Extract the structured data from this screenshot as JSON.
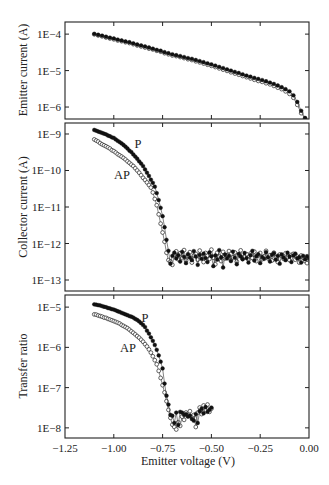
{
  "figure": {
    "xlabel": "Emitter voltage (V)"
  },
  "chart_data": [
    {
      "id": "emitter-current",
      "type": "scatter",
      "title": "",
      "ylabel": "Emitter current (A)",
      "xlabel": "",
      "yscale": "log",
      "xlim": [
        -1.25,
        0.0
      ],
      "ylim": [
        4.7e-07,
        0.000215
      ],
      "xticks": [
        -1.0,
        -0.75,
        -0.5,
        -0.25
      ],
      "xtick_labels": [],
      "yticks": [
        0.0001,
        1e-05,
        1e-06
      ],
      "ytick_labels": [
        "1E−4",
        "1E−5",
        "1E−6"
      ],
      "grid": false,
      "x": [
        -1.1,
        -1.08,
        -1.06,
        -1.04,
        -1.02,
        -1.0,
        -0.98,
        -0.96,
        -0.94,
        -0.92,
        -0.9,
        -0.88,
        -0.86,
        -0.84,
        -0.82,
        -0.8,
        -0.78,
        -0.76,
        -0.74,
        -0.72,
        -0.7,
        -0.68,
        -0.66,
        -0.64,
        -0.62,
        -0.6,
        -0.58,
        -0.56,
        -0.54,
        -0.52,
        -0.5,
        -0.48,
        -0.46,
        -0.44,
        -0.42,
        -0.4,
        -0.38,
        -0.36,
        -0.34,
        -0.32,
        -0.3,
        -0.28,
        -0.26,
        -0.24,
        -0.22,
        -0.2,
        -0.18,
        -0.16,
        -0.14,
        -0.12,
        -0.1,
        -0.08,
        -0.06,
        -0.04,
        -0.02
      ],
      "series": [
        {
          "name": "P",
          "marker": "filled",
          "values": [
            0.000102,
            9.6e-05,
            9.1e-05,
            8.5e-05,
            8e-05,
            7.6e-05,
            7.1e-05,
            6.7e-05,
            6.3e-05,
            6e-05,
            5.6e-05,
            5.2e-05,
            4.9e-05,
            4.6e-05,
            4.3e-05,
            4e-05,
            3.7e-05,
            3.5e-05,
            3.2e-05,
            3e-05,
            2.8e-05,
            2.65e-05,
            2.5e-05,
            2.35e-05,
            2.2e-05,
            2.1e-05,
            1.95e-05,
            1.82e-05,
            1.7e-05,
            1.58e-05,
            1.48e-05,
            1.37e-05,
            1.26e-05,
            1.17e-05,
            1.08e-05,
            1e-05,
            9.2e-06,
            8.6e-06,
            7.9e-06,
            7.3e-06,
            6.8e-06,
            6.3e-06,
            5.9e-06,
            5.5e-06,
            5.1e-06,
            4.7e-06,
            4.3e-06,
            3.9e-06,
            3.5e-06,
            3.1e-06,
            2.7e-06,
            2.1e-06,
            1.38e-06,
            7.9e-07,
            5e-07
          ]
        },
        {
          "name": "AP",
          "marker": "open",
          "values": [
            9.9e-05,
            9.2e-05,
            8.7e-05,
            8.1e-05,
            7.6e-05,
            7.2e-05,
            6.7e-05,
            6.4e-05,
            6e-05,
            5.7e-05,
            5.3e-05,
            4.9e-05,
            4.6e-05,
            4.3e-05,
            4e-05,
            3.8e-05,
            3.5e-05,
            3.3e-05,
            3e-05,
            2.8e-05,
            2.6e-05,
            2.5e-05,
            2.35e-05,
            2.2e-05,
            2.05e-05,
            1.95e-05,
            1.8e-05,
            1.68e-05,
            1.56e-05,
            1.45e-05,
            1.35e-05,
            1.25e-05,
            1.15e-05,
            1.06e-05,
            9.8e-06,
            9e-06,
            8.3e-06,
            7.7e-06,
            7.1e-06,
            6.6e-06,
            6.1e-06,
            5.6e-06,
            5.2e-06,
            4.9e-06,
            4.5e-06,
            4.2e-06,
            3.8e-06,
            3.4e-06,
            3.1e-06,
            2.7e-06,
            2.3e-06,
            1.8e-06,
            1.15e-06,
            6.8e-07,
            4.8e-07
          ]
        }
      ],
      "annotations": []
    },
    {
      "id": "collector-current",
      "type": "scatter",
      "title": "",
      "ylabel": "Collector current (A)",
      "xlabel": "",
      "yscale": "log",
      "xlim": [
        -1.25,
        0.0
      ],
      "ylim": [
        5e-14,
        2e-09
      ],
      "xticks": [
        -1.0,
        -0.75,
        -0.5,
        -0.25
      ],
      "xtick_labels": [],
      "yticks": [
        1e-09,
        1e-10,
        1e-11,
        1e-12,
        1e-13
      ],
      "ytick_labels": [
        "1E−9",
        "1E−10",
        "1E−11",
        "1E−12",
        "1E−13"
      ],
      "grid": false,
      "x": [
        -1.1,
        -1.09,
        -1.08,
        -1.07,
        -1.06,
        -1.05,
        -1.04,
        -1.03,
        -1.02,
        -1.01,
        -1.0,
        -0.99,
        -0.98,
        -0.97,
        -0.96,
        -0.95,
        -0.94,
        -0.93,
        -0.92,
        -0.91,
        -0.9,
        -0.89,
        -0.88,
        -0.87,
        -0.86,
        -0.85,
        -0.84,
        -0.83,
        -0.82,
        -0.81,
        -0.8,
        -0.79,
        -0.78,
        -0.77,
        -0.76,
        -0.75,
        -0.74,
        -0.73,
        -0.72,
        -0.71,
        -0.7,
        -0.69,
        -0.68,
        -0.67,
        -0.66,
        -0.65,
        -0.64,
        -0.63,
        -0.62,
        -0.61,
        -0.6,
        -0.59,
        -0.58,
        -0.57,
        -0.56,
        -0.55,
        -0.54,
        -0.53,
        -0.52,
        -0.51,
        -0.5,
        -0.49,
        -0.48,
        -0.47,
        -0.46,
        -0.45,
        -0.44,
        -0.43,
        -0.42,
        -0.41,
        -0.4,
        -0.39,
        -0.38,
        -0.37,
        -0.36,
        -0.35,
        -0.34,
        -0.33,
        -0.32,
        -0.31,
        -0.3,
        -0.29,
        -0.28,
        -0.27,
        -0.26,
        -0.25,
        -0.24,
        -0.23,
        -0.22,
        -0.21,
        -0.2,
        -0.19,
        -0.18,
        -0.17,
        -0.16,
        -0.15,
        -0.14,
        -0.13,
        -0.12,
        -0.11,
        -0.1,
        -0.09,
        -0.08,
        -0.07,
        -0.06,
        -0.05,
        -0.04,
        -0.03,
        -0.02,
        -0.01,
        0.0
      ],
      "series": [
        {
          "name": "P",
          "marker": "filled",
          "values": [
            1.29e-09,
            1.23e-09,
            1.17e-09,
            1.12e-09,
            1.07e-09,
            1.02e-09,
            9.8e-10,
            9.1e-10,
            8.7e-10,
            8.1e-10,
            7.8e-10,
            7.1e-10,
            6.5e-10,
            6e-10,
            5.5e-10,
            5e-10,
            4.5e-10,
            4e-10,
            3.5e-10,
            3.2e-10,
            2.75e-10,
            2.4e-10,
            2.1e-10,
            1.78e-10,
            1.55e-10,
            1.32e-10,
            1.07e-10,
            8.7e-11,
            7.1e-11,
            5.6e-11,
            4.6e-11,
            3.6e-11,
            2.4e-11,
            1.55e-11,
            9.5e-12,
            5.6e-12,
            2.8e-12,
            1.26e-12,
            6.3e-13,
            2.8e-13,
            4.6e-13,
            5.6e-13,
            3.9e-13,
            4.8e-13,
            3.2e-13,
            5.9e-13,
            4.3e-13,
            2.9e-13,
            5.1e-13,
            4.1e-13,
            3.5e-13,
            6.2e-13,
            4.4e-13,
            2.6e-13,
            4.9e-13,
            3.8e-13,
            5.3e-13,
            4e-13,
            3.1e-13,
            5.7e-13,
            4.5e-13,
            2.4e-13,
            4.7e-13,
            3.6e-13,
            6.6e-13,
            4.2e-13,
            2.2e-13,
            5e-13,
            3.9e-13,
            4.6e-13,
            3.3e-13,
            6e-13,
            4.1e-13,
            2.7e-13,
            5.2e-13,
            4.4e-13,
            3.7e-13,
            5.5e-13,
            4e-13,
            3e-13,
            4.8e-13,
            6.3e-13,
            3.4e-13,
            4.5e-13,
            5.1e-13,
            2.9e-13,
            4.3e-13,
            3.8e-13,
            5.8e-13,
            4.2e-13,
            3.2e-13,
            4.9e-13,
            5.4e-13,
            3.6e-13,
            4.6e-13,
            2.8e-13,
            5e-13,
            4.1e-13,
            3.5e-13,
            5.6e-13,
            4.4e-13,
            3.1e-13,
            4.7e-13,
            5.3e-13,
            3.9e-13,
            4.2e-13,
            3e-13,
            4.6e-13,
            3.7e-13,
            4.5e-13,
            4e-13
          ]
        },
        {
          "name": "AP",
          "marker": "open",
          "values": [
            7.1e-10,
            6.6e-10,
            6.2e-10,
            5.6e-10,
            5.2e-10,
            4.9e-10,
            4.6e-10,
            4.3e-10,
            4e-10,
            3.6e-10,
            3.4e-10,
            3.1e-10,
            2.8e-10,
            2.6e-10,
            2.4e-10,
            2.2e-10,
            2e-10,
            1.78e-10,
            1.62e-10,
            1.45e-10,
            1.32e-10,
            1.15e-10,
            1e-10,
            8.7e-11,
            7.4e-11,
            6.3e-11,
            5.5e-11,
            4.7e-11,
            4e-11,
            3.4e-11,
            2.5e-11,
            1.66e-11,
            1.12e-11,
            6.3e-12,
            3.5e-12,
            2e-12,
            1.12e-12,
            5.6e-13,
            3.5e-13,
            3.2e-13,
            2.6e-13,
            4.9e-13,
            6.1e-13,
            3.7e-13,
            5.4e-13,
            4e-13,
            6.6e-13,
            3.4e-13,
            4.5e-13,
            5.8e-13,
            3e-13,
            4.7e-13,
            5.2e-13,
            3.6e-13,
            6.4e-13,
            4.3e-13,
            3.1e-13,
            5.5e-13,
            4.6e-13,
            3.8e-13,
            6.8e-13,
            4.1e-13,
            2.7e-13,
            5.6e-13,
            4.4e-13,
            3.3e-13,
            5.9e-13,
            3.9e-13,
            4.8e-13,
            6.2e-13,
            3.5e-13,
            4.2e-13,
            5.7e-13,
            3.2e-13,
            4.9e-13,
            6.5e-13,
            3.8e-13,
            4.4e-13,
            5.1e-13,
            3.6e-13,
            5.3e-13,
            4e-13,
            6e-13,
            3.3e-13,
            4.7e-13,
            5.5e-13,
            3.7e-13,
            4.5e-13,
            6.3e-13,
            3.9e-13,
            4.8e-13,
            3.4e-13,
            5.6e-13,
            4.2e-13,
            3.1e-13,
            5e-13,
            4.6e-13,
            3.8e-13,
            5.4e-13,
            4.3e-13,
            3.5e-13,
            4.9e-13,
            5.2e-13,
            3.6e-13,
            4.4e-13,
            3e-13,
            4.7e-13,
            4.1e-13,
            3.3e-13,
            2.9e-13,
            3.9e-13
          ]
        }
      ],
      "annotations": [
        {
          "text": "P",
          "x": -0.876,
          "y": 5.4e-10
        },
        {
          "text": "AP",
          "x": -0.958,
          "y": 7.6e-11
        }
      ]
    },
    {
      "id": "transfer-ratio",
      "type": "scatter",
      "title": "",
      "ylabel": "Transfer ratio",
      "xlabel": "Emitter voltage (V)",
      "yscale": "log",
      "xlim": [
        -1.25,
        0.0
      ],
      "ylim": [
        5.6e-09,
        2e-05
      ],
      "xticks": [
        -1.25,
        -1.0,
        -0.75,
        -0.5,
        -0.25,
        0.0
      ],
      "xtick_labels": [
        "−1.25",
        "−1.00",
        "−0.75",
        "−0.50",
        "−0.25",
        "0.00"
      ],
      "yticks": [
        1e-05,
        1e-06,
        1e-07,
        1e-08
      ],
      "ytick_labels": [
        "1E−5",
        "1E−6",
        "1E−7",
        "1E−8"
      ],
      "grid": false,
      "x": [
        -1.1,
        -1.09,
        -1.08,
        -1.07,
        -1.06,
        -1.05,
        -1.04,
        -1.03,
        -1.02,
        -1.01,
        -1.0,
        -0.99,
        -0.98,
        -0.97,
        -0.96,
        -0.95,
        -0.94,
        -0.93,
        -0.92,
        -0.91,
        -0.9,
        -0.89,
        -0.88,
        -0.87,
        -0.86,
        -0.85,
        -0.84,
        -0.83,
        -0.82,
        -0.81,
        -0.8,
        -0.79,
        -0.78,
        -0.77,
        -0.76,
        -0.75,
        -0.74,
        -0.73,
        -0.72,
        -0.71,
        -0.7,
        -0.69,
        -0.68,
        -0.67,
        -0.66,
        -0.65,
        -0.64,
        -0.63,
        -0.62,
        -0.61,
        -0.6,
        -0.59,
        -0.58,
        -0.57,
        -0.56,
        -0.55,
        -0.54,
        -0.53,
        -0.52,
        -0.51,
        -0.5
      ],
      "series": [
        {
          "name": "P",
          "marker": "filled",
          "values": [
            1.17e-05,
            1.15e-05,
            1.12e-05,
            1.1e-05,
            1.06e-05,
            1.02e-05,
            1e-05,
            9.5e-06,
            9.3e-06,
            8.9e-06,
            8.7e-06,
            8.3e-06,
            7.9e-06,
            7.6e-06,
            7.2e-06,
            6.9e-06,
            6.6e-06,
            6.3e-06,
            6e-06,
            5.8e-06,
            5.5e-06,
            5.1e-06,
            4.8e-06,
            4.4e-06,
            4e-06,
            3.6e-06,
            3.2e-06,
            2.6e-06,
            2.2e-06,
            1.78e-06,
            1.45e-06,
            1.15e-06,
            8.7e-07,
            6.3e-07,
            4.4e-07,
            3e-07,
            1.26e-07,
            6.3e-08,
            3.8e-08,
            2.1e-08,
            2e-08,
            1.32e-08,
            2.4e-08,
            1.17e-08,
            2.5e-08,
            2.4e-08,
            2.1e-08,
            2.2e-08,
            1.9e-08,
            2e-08,
            1.66e-08,
            1.51e-08,
            2.2e-08,
            1.32e-08,
            2.6e-08,
            3e-08,
            2.3e-08,
            3.3e-08,
            2.5e-08,
            2.8e-08,
            3.2e-08
          ]
        },
        {
          "name": "AP",
          "marker": "open",
          "values": [
            6.6e-06,
            6.5e-06,
            6.2e-06,
            6e-06,
            5.8e-06,
            5.5e-06,
            5.4e-06,
            5.1e-06,
            4.9e-06,
            4.7e-06,
            4.5e-06,
            4.3e-06,
            4.1e-06,
            3.9e-06,
            3.6e-06,
            3.4e-06,
            3.2e-06,
            3e-06,
            2.75e-06,
            2.5e-06,
            2.3e-06,
            2.1e-06,
            1.9e-06,
            1.74e-06,
            1.55e-06,
            1.38e-06,
            1.2e-06,
            1.05e-06,
            8.9e-07,
            7.4e-07,
            6e-07,
            4.8e-07,
            3.8e-07,
            2.6e-07,
            1.74e-07,
            1.15e-07,
            7.6e-08,
            4.6e-08,
            2.8e-08,
            1.78e-08,
            1.2e-08,
            1.05e-08,
            9.1e-09,
            1.38e-08,
            1.12e-08,
            1.9e-08,
            1.58e-08,
            2.4e-08,
            2e-08,
            2.6e-08,
            1.82e-08,
            2.1e-08,
            1.05e-08,
            2.4e-08,
            3.2e-08,
            2.2e-08,
            3.6e-08,
            2.75e-08,
            3.8e-08,
            2.5e-08,
            3e-08
          ]
        }
      ],
      "annotations": [
        {
          "text": "P",
          "x": -0.84,
          "y": 5.4e-06
        },
        {
          "text": "AP",
          "x": -0.927,
          "y": 9.5e-07
        }
      ]
    }
  ]
}
